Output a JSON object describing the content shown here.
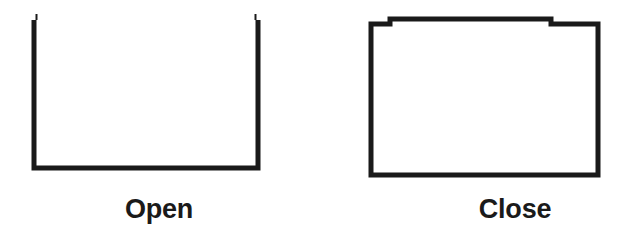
{
  "diagram": {
    "background_color": "#ffffff",
    "stroke_color": "#1a1a1a",
    "panels": [
      {
        "id": "open",
        "caption": "Open",
        "shape_name": "open-container-u-shape",
        "description": "U shape: two vertical walls and a bottom edge, no top edge",
        "stroke_width": 5,
        "geometry": {
          "left_wall_x": 34,
          "right_wall_x": 258,
          "top_y": 20,
          "bottom_y": 168
        }
      },
      {
        "id": "close",
        "caption": "Close",
        "shape_name": "closed-container-rectangle",
        "description": "Closed rectangle with raised middle top lid segment",
        "stroke_width": 5,
        "geometry": {
          "left_wall_x": 53,
          "right_wall_x": 280,
          "top_y": 24,
          "bottom_y": 175,
          "lid_left_x": 72,
          "lid_right_x": 233,
          "lid_top_y": 19
        }
      }
    ]
  }
}
